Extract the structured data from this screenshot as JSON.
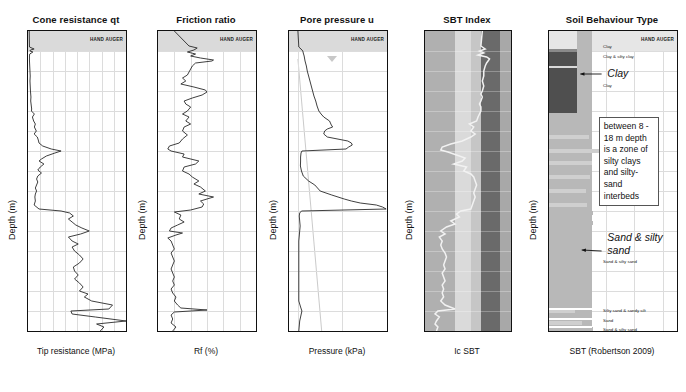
{
  "figure": {
    "depth_axis_label": "Depth (m)",
    "depth_ticks": [
      0,
      2,
      4,
      6,
      8,
      10,
      12,
      14,
      16,
      18,
      20,
      22,
      24,
      26,
      28,
      30
    ],
    "depth_range": [
      0,
      30
    ],
    "hand_auger_label": "HAND AUGER",
    "hand_auger_depth": [
      0,
      2.0
    ]
  },
  "panels": [
    {
      "title": "Cone resistance qt",
      "xlabel": "Tip resistance (MPa)",
      "xticks": [
        0,
        5,
        10,
        15,
        20,
        25,
        30,
        35,
        40
      ],
      "xrange": [
        0,
        40
      ]
    },
    {
      "title": "Friction ratio",
      "xlabel": "Rf (%)",
      "xticks": [
        0,
        1,
        2,
        3,
        4,
        5,
        6
      ],
      "xrange": [
        0,
        6
      ]
    },
    {
      "title": "Pore pressure u",
      "xlabel": "Pressure (kPa)",
      "xticks": [
        0,
        500,
        "1,000"
      ],
      "xtickvals": [
        0,
        500,
        1000
      ],
      "xrange": [
        -100,
        1000
      ],
      "water_table_depth": 2.8
    },
    {
      "title": "SBT Index",
      "xlabel": "Ic SBT",
      "xticks": [
        1,
        2,
        3,
        4
      ],
      "xrange": [
        1,
        4
      ],
      "bands": [
        {
          "from": 1.0,
          "to": 2.05,
          "color": "#b0b0b0"
        },
        {
          "from": 2.05,
          "to": 2.6,
          "color": "#dadada"
        },
        {
          "from": 2.6,
          "to": 2.95,
          "color": "#c6c6c6"
        },
        {
          "from": 2.95,
          "to": 3.6,
          "color": "#6a6a6a"
        },
        {
          "from": 3.6,
          "to": 4.0,
          "color": "#a8a8a8"
        }
      ],
      "trace_color": "#f2f2f2"
    },
    {
      "title": "Soil Behaviour Type",
      "xlabel": "SBT (Robertson 2009)",
      "xticks": [
        0,
        4,
        8,
        12,
        16
      ],
      "xrange": [
        0,
        18
      ],
      "annotations": [
        {
          "text": "Clay",
          "style": "italic"
        },
        {
          "text": "Sand & silty sand",
          "style": "italic"
        }
      ],
      "small_labels": [
        {
          "text": "Clay",
          "depth": 1.5
        },
        {
          "text": "Clay & silty clay",
          "depth": 2.5
        },
        {
          "text": "Clay",
          "depth": 5.4
        },
        {
          "text": "Sand & silty sand",
          "depth": 23.0
        },
        {
          "text": "Silty sand & sandy silt",
          "depth": 27.9
        },
        {
          "text": "Sand",
          "depth": 28.9
        },
        {
          "text": "Sand & silty sand",
          "depth": 29.8
        }
      ],
      "callout_text": "between 8 - 18 m depth is a zone of silty clays and silty-sand interbeds"
    }
  ],
  "chart_data": {
    "type": "line",
    "ylabel": "Depth (m)",
    "ylim": [
      0,
      30
    ],
    "grid": true,
    "legend": "none",
    "series": [
      {
        "name": "Cone resistance qt",
        "panel": 0,
        "xlabel": "Tip resistance (MPa)",
        "xlim": [
          0,
          40
        ],
        "depth": [
          0.0,
          1.6,
          1.8,
          1.9,
          2.0,
          2.1,
          2.3,
          2.5,
          3.0,
          3.5,
          4.0,
          4.5,
          5.0,
          5.5,
          6.0,
          6.3,
          6.6,
          7.0,
          7.4,
          7.8,
          8.0,
          8.3,
          8.6,
          9.0,
          9.3,
          9.6,
          10.0,
          10.3,
          10.6,
          10.9,
          11.2,
          11.5,
          11.8,
          12.0,
          12.2,
          12.5,
          12.8,
          13.0,
          13.3,
          13.6,
          13.9,
          14.2,
          14.5,
          14.8,
          15.1,
          15.4,
          15.7,
          16.0,
          16.3,
          16.6,
          17.0,
          17.4,
          17.8,
          18.0,
          18.2,
          18.5,
          18.8,
          19.1,
          19.4,
          19.7,
          20.0,
          20.3,
          20.6,
          21.0,
          21.3,
          21.6,
          22.0,
          22.4,
          22.8,
          23.2,
          23.6,
          24.0,
          24.4,
          24.8,
          25.2,
          25.6,
          26.0,
          26.3,
          26.6,
          27.0,
          27.4,
          27.8,
          28.0,
          28.3,
          28.6,
          29.0,
          29.3,
          29.6,
          30.0
        ],
        "values": [
          0.5,
          0.6,
          2.5,
          1.0,
          0.8,
          2.0,
          0.7,
          0.6,
          0.6,
          0.7,
          0.8,
          0.9,
          0.8,
          0.9,
          1.0,
          1.1,
          1.2,
          1.1,
          1.3,
          1.5,
          1.4,
          2.6,
          1.8,
          2.3,
          3.0,
          2.6,
          3.4,
          2.5,
          3.8,
          4.2,
          4.5,
          6.0,
          9.5,
          13.5,
          11.0,
          7.5,
          5.5,
          4.5,
          6.5,
          5.0,
          4.0,
          5.5,
          4.0,
          3.5,
          4.0,
          3.5,
          3.0,
          3.5,
          3.0,
          2.8,
          3.0,
          2.5,
          4.5,
          13.5,
          17.0,
          18.5,
          16.5,
          18.0,
          19.5,
          22.0,
          25.0,
          21.5,
          16.5,
          18.0,
          20.5,
          18.0,
          19.0,
          21.0,
          22.5,
          21.0,
          18.5,
          19.0,
          20.5,
          19.0,
          21.0,
          22.5,
          21.0,
          24.5,
          23.0,
          26.0,
          34.5,
          33.0,
          17.5,
          18.0,
          27.5,
          40.0,
          28.0,
          31.0,
          29.5
        ]
      },
      {
        "name": "Friction ratio",
        "panel": 1,
        "xlabel": "Rf (%)",
        "xlim": [
          0,
          6
        ],
        "depth": [
          0.0,
          1.5,
          1.7,
          1.9,
          2.1,
          2.3,
          2.5,
          2.7,
          2.9,
          3.0,
          3.2,
          3.5,
          3.8,
          4.1,
          4.4,
          4.7,
          5.0,
          5.3,
          5.6,
          5.9,
          6.1,
          6.4,
          6.7,
          7.0,
          7.3,
          7.6,
          8.0,
          8.3,
          8.6,
          9.0,
          9.3,
          9.6,
          10.0,
          10.4,
          10.8,
          11.2,
          11.5,
          11.8,
          12.0,
          12.3,
          12.6,
          13.0,
          13.3,
          13.6,
          14.0,
          14.3,
          14.6,
          15.0,
          15.3,
          15.6,
          16.0,
          16.3,
          16.6,
          17.0,
          17.3,
          17.6,
          17.9,
          18.1,
          18.4,
          18.8,
          19.1,
          19.4,
          19.7,
          20.0,
          20.2,
          20.4,
          20.7,
          21.0,
          21.4,
          21.8,
          22.2,
          22.6,
          23.0,
          23.4,
          23.8,
          24.2,
          24.6,
          25.0,
          25.4,
          25.8,
          26.2,
          26.6,
          27.0,
          27.4,
          27.7,
          27.9,
          28.1,
          28.4,
          28.8,
          29.2,
          29.6,
          30.0
        ],
        "values": [
          1.0,
          1.9,
          2.4,
          2.2,
          1.8,
          2.3,
          2.0,
          2.6,
          3.4,
          3.3,
          2.3,
          2.1,
          2.0,
          1.9,
          1.8,
          1.5,
          1.7,
          1.4,
          2.2,
          2.9,
          3.0,
          2.7,
          2.1,
          1.6,
          1.7,
          2.0,
          1.8,
          1.5,
          1.9,
          1.7,
          2.0,
          1.6,
          1.5,
          1.8,
          1.5,
          1.3,
          0.7,
          0.6,
          0.8,
          1.6,
          1.5,
          2.5,
          2.3,
          1.6,
          1.5,
          1.9,
          2.1,
          2.5,
          2.2,
          2.6,
          2.9,
          2.5,
          3.4,
          2.6,
          2.8,
          2.7,
          2.0,
          1.0,
          1.4,
          1.3,
          1.6,
          1.2,
          0.8,
          0.7,
          1.5,
          1.1,
          0.6,
          0.8,
          0.9,
          1.0,
          0.8,
          0.9,
          1.0,
          0.9,
          0.8,
          0.9,
          1.0,
          0.9,
          1.0,
          0.8,
          0.9,
          1.1,
          1.0,
          1.2,
          1.4,
          3.0,
          1.0,
          0.8,
          0.9,
          0.8,
          1.1,
          0.9
        ]
      },
      {
        "name": "Pore pressure u",
        "panel": 2,
        "xlabel": "Pressure (kPa)",
        "xlim": [
          -100,
          1000
        ],
        "depth": [
          0.0,
          1.6,
          1.8,
          2.0,
          2.2,
          2.5,
          3.0,
          3.5,
          4.0,
          4.5,
          5.0,
          5.5,
          6.0,
          6.5,
          7.0,
          7.5,
          8.0,
          8.3,
          8.6,
          9.0,
          9.4,
          9.6,
          9.8,
          10.0,
          10.3,
          10.6,
          11.0,
          11.2,
          11.4,
          11.6,
          11.8,
          12.0,
          12.2,
          12.6,
          13.0,
          13.5,
          14.0,
          14.5,
          15.0,
          15.4,
          15.8,
          16.0,
          16.4,
          16.8,
          17.0,
          17.2,
          17.4,
          17.6,
          17.8,
          18.0,
          18.2,
          18.5,
          19.0,
          19.5,
          20.0,
          20.5,
          21.0,
          22.0,
          23.0,
          24.0,
          25.0,
          26.0,
          27.0,
          27.6,
          28.0,
          28.4,
          29.0,
          29.5,
          30.0
        ],
        "values": [
          0,
          10,
          35,
          55,
          60,
          70,
          80,
          95,
          105,
          120,
          135,
          150,
          165,
          180,
          200,
          215,
          235,
          260,
          290,
          355,
          375,
          390,
          330,
          300,
          290,
          330,
          560,
          600,
          610,
          570,
          540,
          45,
          35,
          30,
          30,
          28,
          40,
          60,
          120,
          190,
          230,
          250,
          380,
          520,
          600,
          700,
          880,
          950,
          990,
          40,
          20,
          15,
          20,
          25,
          20,
          15,
          10,
          10,
          10,
          10,
          10,
          10,
          10,
          30,
          45,
          35,
          20,
          15,
          10
        ]
      },
      {
        "name": "SBT Index Ic",
        "panel": 3,
        "xlabel": "Ic SBT",
        "xlim": [
          1,
          4
        ],
        "depth": [
          0.0,
          1.5,
          1.8,
          2.0,
          2.2,
          2.4,
          2.6,
          2.8,
          3.0,
          3.2,
          3.5,
          4.0,
          4.5,
          5.0,
          5.5,
          6.0,
          6.3,
          6.6,
          7.0,
          7.3,
          7.6,
          8.0,
          8.3,
          8.6,
          9.0,
          9.3,
          9.6,
          10.0,
          10.3,
          10.6,
          11.0,
          11.3,
          11.6,
          11.9,
          12.1,
          12.4,
          12.7,
          13.0,
          13.3,
          13.6,
          14.0,
          14.3,
          14.6,
          15.0,
          15.4,
          15.8,
          16.2,
          16.6,
          17.0,
          17.4,
          17.8,
          18.0,
          18.3,
          18.6,
          19.0,
          19.3,
          19.6,
          20.0,
          20.3,
          20.6,
          21.0,
          21.4,
          21.8,
          22.2,
          22.6,
          23.0,
          23.4,
          23.8,
          24.2,
          24.6,
          25.0,
          25.4,
          25.8,
          26.2,
          26.6,
          27.0,
          27.4,
          27.8,
          28.0,
          28.3,
          28.6,
          29.0,
          29.3,
          29.6,
          30.0
        ],
        "values": [
          3.0,
          2.95,
          3.1,
          2.9,
          3.05,
          2.85,
          3.15,
          3.25,
          3.2,
          3.15,
          3.1,
          3.05,
          3.05,
          3.0,
          3.05,
          3.0,
          2.95,
          3.0,
          2.95,
          2.9,
          2.95,
          2.95,
          2.9,
          2.85,
          2.8,
          2.55,
          2.7,
          2.6,
          2.75,
          2.6,
          2.3,
          1.9,
          1.6,
          1.55,
          1.8,
          2.1,
          2.4,
          2.3,
          2.0,
          2.45,
          2.35,
          2.6,
          2.7,
          2.75,
          2.8,
          2.75,
          2.7,
          2.75,
          2.7,
          2.65,
          2.6,
          2.25,
          2.1,
          2.2,
          1.9,
          2.05,
          1.75,
          1.55,
          1.7,
          1.5,
          1.6,
          1.55,
          1.6,
          1.7,
          1.75,
          1.7,
          1.65,
          1.7,
          1.6,
          1.65,
          1.7,
          1.6,
          1.65,
          1.6,
          1.65,
          1.55,
          1.7,
          2.05,
          1.45,
          1.35,
          1.5,
          1.4,
          1.35,
          1.45,
          1.4
        ]
      },
      {
        "name": "Soil Behaviour Type (Robertson 2009)",
        "panel": 4,
        "xlabel": "SBT (Robertson 2009)",
        "xlim": [
          0,
          18
        ],
        "bars": [
          {
            "depth": 0.1,
            "value": 4.0,
            "shade": "#e8e8e8"
          },
          {
            "depth": 1.8,
            "value": 6.2,
            "shade": "#8a8a8a"
          },
          {
            "depth": 2.0,
            "value": 4.0,
            "shade": "#4a4a4a"
          },
          {
            "depth": 3.4,
            "value": 4.0,
            "shade": "#4a4a4a"
          },
          {
            "depth": 3.6,
            "value": 4.0,
            "shade": "#4a4a4a"
          },
          {
            "depth": 8.2,
            "value": 4.5,
            "shade": "#b8b8b8"
          },
          {
            "depth": 9.4,
            "value": 4.5,
            "shade": "#b8b8b8"
          },
          {
            "depth": 10.4,
            "value": 5.6,
            "shade": "#cfcfcf"
          },
          {
            "depth": 11.0,
            "value": 4.5,
            "shade": "#b8b8b8"
          },
          {
            "depth": 11.8,
            "value": 7.4,
            "shade": "#cfcfcf"
          },
          {
            "depth": 12.4,
            "value": 4.5,
            "shade": "#b8b8b8"
          },
          {
            "depth": 13.0,
            "value": 6.0,
            "shade": "#cfcfcf"
          },
          {
            "depth": 13.6,
            "value": 4.5,
            "shade": "#b8b8b8"
          },
          {
            "depth": 14.4,
            "value": 5.8,
            "shade": "#cfcfcf"
          },
          {
            "depth": 15.0,
            "value": 4.5,
            "shade": "#b8b8b8"
          },
          {
            "depth": 15.8,
            "value": 5.2,
            "shade": "#cfcfcf"
          },
          {
            "depth": 16.4,
            "value": 4.5,
            "shade": "#b8b8b8"
          },
          {
            "depth": 17.2,
            "value": 5.4,
            "shade": "#cfcfcf"
          },
          {
            "depth": 18.0,
            "value": 6.2,
            "shade": "#b8b8b8"
          },
          {
            "depth": 19.0,
            "value": 6.2,
            "shade": "#b8b8b8"
          },
          {
            "depth": 27.8,
            "value": 3.6,
            "shade": "#cfcfcf"
          },
          {
            "depth": 28.8,
            "value": 5.0,
            "shade": "#b8b8b8"
          },
          {
            "depth": 29.6,
            "value": 6.2,
            "shade": "#b8b8b8"
          }
        ]
      }
    ]
  }
}
